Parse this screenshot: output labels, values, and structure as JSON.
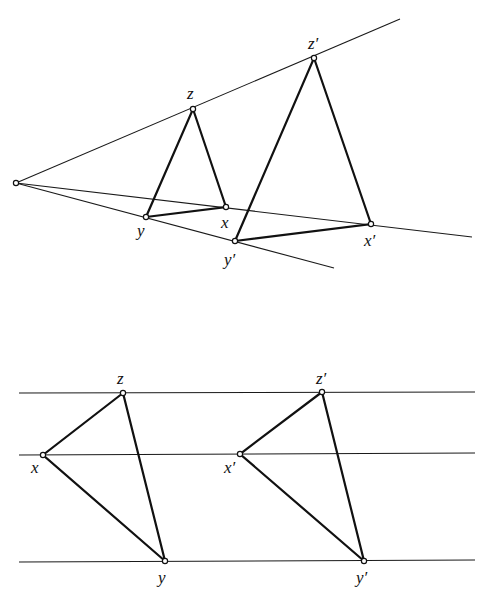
{
  "figure_top": {
    "title": "Central projection (homothety) of triangle xyz to x'y'z'",
    "center": {
      "x": 16,
      "y": 183
    },
    "rays": [
      {
        "name": "ray-z",
        "x2": 430,
        "y2": 20
      },
      {
        "name": "ray-x",
        "x2": 472,
        "y2": 237
      },
      {
        "name": "ray-y",
        "x2": 334,
        "y2": 268
      }
    ],
    "triangle_small": {
      "points": {
        "x": [
          226,
          207
        ],
        "y": [
          146,
          217
        ],
        "z": [
          193,
          109
        ]
      },
      "labels": {
        "x": "x",
        "y": "y",
        "z": "z"
      }
    },
    "triangle_large": {
      "points": {
        "x": [
          371,
          224
        ],
        "y": [
          235,
          241
        ],
        "z": [
          314,
          58
        ]
      },
      "labels": {
        "x": "x′",
        "y": "y′",
        "z": "z′"
      }
    }
  },
  "figure_bottom": {
    "title": "Parallel translation of triangle xyz to x'y'z'",
    "lines_y": [
      393,
      455,
      561
    ],
    "line_x_start": 19,
    "line_x_end": 475,
    "triangle_left": {
      "points": {
        "x": [
          43,
          455
        ],
        "y": [
          165,
          561
        ],
        "z": [
          123,
          393
        ]
      },
      "labels": {
        "x": "x",
        "y": "y",
        "z": "z"
      }
    },
    "triangle_right": {
      "points": {
        "x": [
          240,
          454
        ],
        "y": [
          364,
          561
        ],
        "z": [
          322,
          392
        ]
      },
      "labels": {
        "x": "x′",
        "y": "y′",
        "z": "z′"
      }
    }
  }
}
